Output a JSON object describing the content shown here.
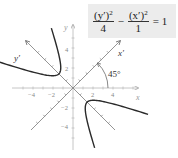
{
  "equation": {
    "term1_num_base": "(y′)",
    "term1_num_exp": "2",
    "term1_den": "4",
    "minus": "−",
    "term2_num_base": "(x′)",
    "term2_num_exp": "2",
    "term2_den": "1",
    "equals": "= 1"
  },
  "axes": {
    "x_label": "x",
    "y_label": "y",
    "x_prime_label": "x′",
    "y_prime_label": "y′",
    "angle_label": "45°",
    "x_tick_labels": [
      "−4",
      "−2",
      "2",
      "4"
    ],
    "y_tick_labels": [
      "4",
      "2",
      "−2",
      "−4"
    ]
  },
  "colors": {
    "axis": "#b8b8b8",
    "rotated_axis": "#7a7a7a",
    "curve": "#2a2a2a",
    "text": "#555555",
    "equation_bg": "#ececec"
  },
  "chart_data": {
    "type": "diagram",
    "rotation_degrees": 45,
    "hyperbola": {
      "a_yprime": 2,
      "b_xprime": 1,
      "orientation": "y-prime transverse"
    },
    "x_range": [
      -6,
      6.5
    ],
    "y_range": [
      -6,
      6.2
    ],
    "x_ticks": [
      -4,
      -2,
      2,
      4
    ],
    "y_ticks": [
      -4,
      -2,
      2,
      4
    ],
    "grid": false
  }
}
